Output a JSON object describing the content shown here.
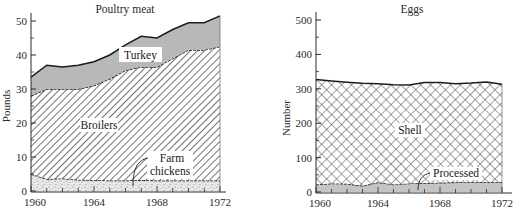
{
  "chart_data": [
    {
      "type": "area",
      "stacked": true,
      "title": "Poultry meat",
      "xlabel": "",
      "ylabel": "Pounds",
      "x": [
        1960,
        1961,
        1962,
        1963,
        1964,
        1965,
        1966,
        1967,
        1968,
        1969,
        1970,
        1971,
        1972
      ],
      "xticks": [
        1960,
        1964,
        1968,
        1972
      ],
      "yticks": [
        0,
        10,
        20,
        30,
        40,
        50
      ],
      "xlim": [
        1960,
        1972.5
      ],
      "ylim": [
        0,
        52
      ],
      "series": [
        {
          "name": "Farm chickens",
          "pattern": "stipple",
          "values": [
            5.0,
            3.5,
            3.7,
            3.3,
            3.2,
            3.1,
            3.1,
            3.2,
            3.1,
            3.1,
            3.1,
            3.1,
            3.1
          ]
        },
        {
          "name": "Broilers",
          "pattern": "hatch",
          "values": [
            23.0,
            26.5,
            26.3,
            26.7,
            27.8,
            29.9,
            32.4,
            33.3,
            33.4,
            35.9,
            38.4,
            38.4,
            39.4
          ]
        },
        {
          "name": "Turkey",
          "pattern": "gray",
          "values": [
            5.5,
            7.0,
            6.5,
            7.0,
            7.0,
            7.0,
            7.5,
            9.0,
            8.5,
            8.5,
            8.0,
            8.0,
            9.0
          ]
        }
      ],
      "totals": [
        33.5,
        37.0,
        36.5,
        37.0,
        38.0,
        40.0,
        43.0,
        45.5,
        45.0,
        47.5,
        49.5,
        49.5,
        51.5
      ]
    },
    {
      "type": "area",
      "stacked": true,
      "title": "Eggs",
      "xlabel": "",
      "ylabel": "Number",
      "x": [
        1960,
        1961,
        1962,
        1963,
        1964,
        1965,
        1966,
        1967,
        1968,
        1969,
        1970,
        1971,
        1972
      ],
      "xticks": [
        1960,
        1964,
        1968,
        1972
      ],
      "yticks": [
        0,
        100,
        200,
        300,
        400,
        500
      ],
      "xlim": [
        1960,
        1972.5
      ],
      "ylim": [
        0,
        520
      ],
      "series": [
        {
          "name": "Processed",
          "pattern": "gray",
          "values": [
            22,
            25,
            24,
            18,
            28,
            22,
            25,
            26,
            27,
            28,
            28,
            28,
            28
          ]
        },
        {
          "name": "Shell",
          "pattern": "crosshatch",
          "values": [
            305,
            298,
            295,
            298,
            287,
            290,
            286,
            292,
            291,
            287,
            289,
            292,
            285
          ]
        }
      ],
      "totals": [
        327,
        323,
        319,
        316,
        315,
        312,
        311,
        318,
        318,
        315,
        317,
        320,
        313
      ]
    }
  ],
  "labels": {
    "poultry_title": "Poultry meat",
    "poultry_ylabel": "Pounds",
    "turkey": "Turkey",
    "broilers": "Broilers",
    "farm_line1": "Farm",
    "farm_line2": "chickens",
    "eggs_title": "Eggs",
    "eggs_ylabel": "Number",
    "shell": "Shell",
    "processed": "Processed"
  },
  "colors": {
    "axis": "#2a2a2a",
    "turkey_fill": "#b8b8b8",
    "processed_fill": "#c4c4c4",
    "stipple_bg": "#e6e6e6",
    "line": "#1c1c1c"
  }
}
